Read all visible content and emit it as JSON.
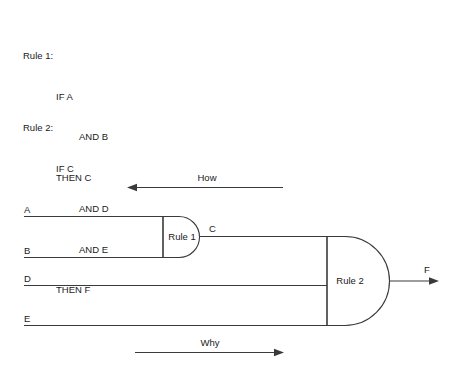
{
  "diagram": {
    "type": "inference-chain",
    "rules": [
      {
        "id": "rule1",
        "heading": "Rule 1:",
        "if": "IF A",
        "and": [
          "AND B"
        ],
        "then": "THEN C"
      },
      {
        "id": "rule2",
        "heading": "Rule 2:",
        "if": "IF C",
        "and": [
          "AND D",
          "AND E"
        ],
        "then": "THEN F"
      }
    ],
    "gates": [
      {
        "label": "Rule 1",
        "inputs": [
          "A",
          "B"
        ],
        "output": "C"
      },
      {
        "label": "Rule 2",
        "inputs": [
          "C",
          "D",
          "E"
        ],
        "output": "F"
      }
    ],
    "signals": {
      "a": "A",
      "b": "B",
      "c": "C",
      "d": "D",
      "e": "E",
      "f": "F"
    },
    "flow": {
      "how": "How",
      "why": "Why"
    },
    "colors": {
      "stroke": "#3a3a3a",
      "text": "#1a1a1a",
      "background": "#ffffff"
    }
  }
}
